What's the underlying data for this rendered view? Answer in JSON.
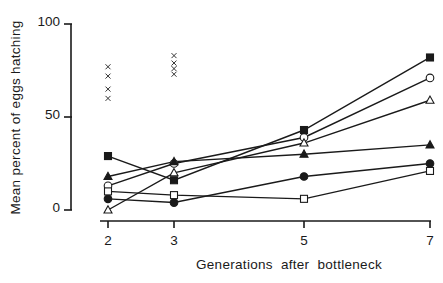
{
  "chart_data": {
    "type": "line",
    "title": "",
    "xlabel": "Generations after bottleneck",
    "ylabel": "Mean percent of eggs hatching",
    "x": [
      2,
      3,
      5,
      7
    ],
    "xticks": [
      "2",
      "3",
      "5",
      "7"
    ],
    "yticks": [
      "0",
      "50",
      "100"
    ],
    "ylim": [
      0,
      100
    ],
    "grid": false,
    "legend": "none",
    "series": [
      {
        "name": "filled-square",
        "marker": "square-filled",
        "values": [
          29,
          16,
          43,
          82
        ]
      },
      {
        "name": "open-circle",
        "marker": "circle-open",
        "values": [
          13,
          25,
          39,
          71
        ]
      },
      {
        "name": "open-triangle",
        "marker": "triangle-open",
        "values": [
          0,
          20,
          36,
          59
        ]
      },
      {
        "name": "filled-triangle",
        "marker": "triangle-filled",
        "values": [
          18,
          26,
          30,
          35
        ]
      },
      {
        "name": "filled-circle",
        "marker": "circle-filled",
        "values": [
          6,
          4,
          18,
          25
        ]
      },
      {
        "name": "open-square",
        "marker": "square-open",
        "values": [
          10,
          8,
          6,
          21
        ]
      }
    ],
    "unconnected_points": {
      "name": "x-marks",
      "marker": "x",
      "points": [
        {
          "x": 2,
          "values": [
            77,
            72,
            65,
            60
          ]
        },
        {
          "x": 3,
          "values": [
            83,
            79,
            76,
            73
          ]
        }
      ]
    }
  },
  "labels": {
    "ylabel": "Mean percent of eggs hatching",
    "xlabel": "Generations after bottleneck",
    "yticks": [
      "100",
      "50",
      "0"
    ],
    "xticks": [
      "2",
      "3",
      "5",
      "7"
    ]
  },
  "colors": {
    "ink": "#1a1a1a",
    "background": "#ffffff"
  }
}
